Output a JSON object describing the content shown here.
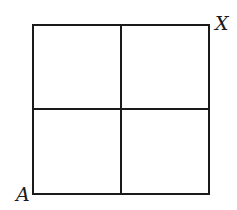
{
  "diagram": {
    "type": "grid",
    "rows": 2,
    "cols": 2,
    "line_color": "#1a1a1a",
    "background": "#ffffff",
    "labels": {
      "bottom_left": "A",
      "top_right": "X"
    }
  }
}
